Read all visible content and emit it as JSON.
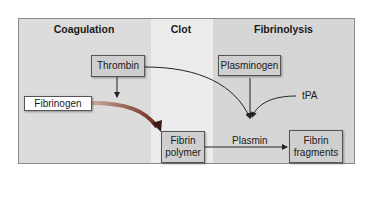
{
  "diagram": {
    "columns": [
      {
        "id": "coagulation",
        "label": "Coagulation"
      },
      {
        "id": "clot",
        "label": "Clot"
      },
      {
        "id": "fibrinolysis",
        "label": "Fibrinolysis"
      }
    ],
    "nodes": {
      "thrombin": "Thrombin",
      "fibrinogen": "Fibrinogen",
      "fibrin_polymer_line1": "Fibrin",
      "fibrin_polymer_line2": "polymer",
      "plasminogen": "Plasminogen",
      "tpa": "tPA",
      "plasmin": "Plasmin",
      "fibrin_fragments_line1": "Fibrin",
      "fibrin_fragments_line2": "fragments"
    },
    "edges": [
      {
        "from": "Thrombin",
        "to": "Fibrinogen-conversion"
      },
      {
        "from": "Fibrinogen",
        "to": "Fibrin polymer"
      },
      {
        "from": "Thrombin",
        "to": "Plasmin"
      },
      {
        "from": "Plasminogen",
        "to": "Plasmin"
      },
      {
        "from": "tPA",
        "to": "Plasmin"
      },
      {
        "from": "Fibrin polymer",
        "to": "Fibrin fragments",
        "via": "Plasmin"
      }
    ],
    "colors": {
      "coagulation_bg": "#dcdcdc",
      "clot_bg": "#ececec",
      "fibrinolysis_bg": "#d6d6d6",
      "box_fill": "#cfcfcf",
      "thick_arrow": "#8a3a2a"
    }
  }
}
